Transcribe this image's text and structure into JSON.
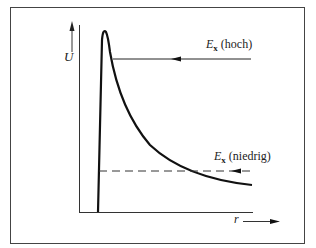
{
  "diagram": {
    "type": "potential-energy-curve",
    "y_axis_label": "U",
    "x_axis_label": "r",
    "levels": [
      {
        "symbol": "E",
        "subscript": "x",
        "qualifier": "(hoch)"
      },
      {
        "symbol": "E",
        "subscript": "x",
        "qualifier": "(niedrig)"
      }
    ],
    "colors": {
      "line": "#1a1a1a",
      "frame": "#444444",
      "background": "#ffffff"
    }
  }
}
